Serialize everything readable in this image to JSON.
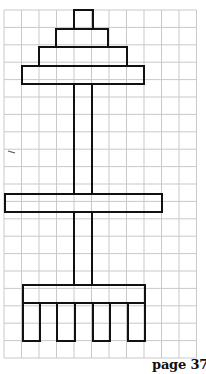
{
  "page": {
    "label": "page 37"
  },
  "grid": {
    "left": 4,
    "top": 10,
    "cols": 11,
    "rows": 20,
    "cell_w": 17.5,
    "cell_h": 17.4,
    "line_color": "#c9c9c9"
  },
  "figure": {
    "stroke_color": "#111111",
    "stroke_width": 2,
    "shapes": [
      {
        "name": "tier-1-rect",
        "x": 74,
        "y": 10,
        "w": 19,
        "h": 19
      },
      {
        "name": "tier-2-rect",
        "x": 56,
        "y": 29,
        "w": 52,
        "h": 18
      },
      {
        "name": "tier-3-rect",
        "x": 39,
        "y": 47,
        "w": 88,
        "h": 19
      },
      {
        "name": "tier-4-rect",
        "x": 22,
        "y": 66,
        "w": 122,
        "h": 18
      },
      {
        "name": "upper-pole-rect",
        "x": 74,
        "y": 84,
        "w": 18,
        "h": 110
      },
      {
        "name": "middle-crossbar-rect",
        "x": 5,
        "y": 194,
        "w": 157,
        "h": 18
      },
      {
        "name": "lower-pole-rect",
        "x": 74,
        "y": 212,
        "w": 18,
        "h": 73
      },
      {
        "name": "base-bar-rect",
        "x": 23,
        "y": 285,
        "w": 122,
        "h": 18
      },
      {
        "name": "leg-1-rect",
        "x": 23,
        "y": 303,
        "w": 17,
        "h": 38
      },
      {
        "name": "leg-2-rect",
        "x": 57,
        "y": 303,
        "w": 18,
        "h": 38
      },
      {
        "name": "leg-3-rect",
        "x": 93,
        "y": 303,
        "w": 17,
        "h": 38
      },
      {
        "name": "leg-4-rect",
        "x": 128,
        "y": 303,
        "w": 17,
        "h": 38
      }
    ],
    "stray_mark": {
      "x1": 8,
      "y1": 151,
      "x2": 15,
      "y2": 153
    }
  }
}
